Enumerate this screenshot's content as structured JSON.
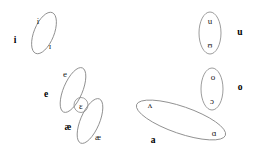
{
  "diagram": {
    "background_color": "#ffffff",
    "ellipse_stroke_color": "#8a8a8a",
    "glyph_color": "#1a1a1a",
    "label_color": "#000000",
    "groups": [
      {
        "id": "i-group",
        "label": "i",
        "label_position": "left",
        "members": [
          "i",
          "ɪ"
        ]
      },
      {
        "id": "e-group",
        "label": "e",
        "label_position": "left",
        "members": [
          "e",
          "ɛ"
        ]
      },
      {
        "id": "ae-group",
        "label": "æ",
        "label_position": "left",
        "members": [
          "ɛ",
          "æ"
        ]
      },
      {
        "id": "u-group",
        "label": "u",
        "label_position": "right",
        "members": [
          "u",
          "ʊ"
        ]
      },
      {
        "id": "o-group",
        "label": "o",
        "label_position": "right",
        "members": [
          "o",
          "ɔ"
        ]
      },
      {
        "id": "a-group",
        "label": "a",
        "label_position": "below-left",
        "members": [
          "ʌ",
          "ɑ"
        ]
      }
    ],
    "glyphs": [
      {
        "id": "glyph-i",
        "text": "i",
        "x": 38,
        "y": 21
      },
      {
        "id": "glyph-small-i",
        "text": "ɪ",
        "x": 50,
        "y": 46
      },
      {
        "id": "glyph-e",
        "text": "e",
        "x": 65,
        "y": 74
      },
      {
        "id": "glyph-eps",
        "text": "ɛ",
        "x": 81,
        "y": 106
      },
      {
        "id": "glyph-ae",
        "text": "æ",
        "x": 98,
        "y": 137
      },
      {
        "id": "glyph-u",
        "text": "u",
        "x": 210,
        "y": 21
      },
      {
        "id": "glyph-ups",
        "text": "ʊ",
        "x": 210,
        "y": 45
      },
      {
        "id": "glyph-o",
        "text": "o",
        "x": 213,
        "y": 77
      },
      {
        "id": "glyph-openo",
        "text": "ɔ",
        "x": 212,
        "y": 101
      },
      {
        "id": "glyph-wedge",
        "text": "ʌ",
        "x": 150,
        "y": 105
      },
      {
        "id": "glyph-script-a",
        "text": "ɑ",
        "x": 214,
        "y": 133
      }
    ],
    "labels": [
      {
        "id": "label-i",
        "text": "i",
        "x": 15,
        "y": 41
      },
      {
        "id": "label-e",
        "text": "e",
        "x": 46,
        "y": 95
      },
      {
        "id": "label-ae",
        "text": "æ",
        "x": 68,
        "y": 128
      },
      {
        "id": "label-u",
        "text": "u",
        "x": 240,
        "y": 33
      },
      {
        "id": "label-o",
        "text": "o",
        "x": 240,
        "y": 88
      },
      {
        "id": "label-a",
        "text": "a",
        "x": 153,
        "y": 141
      }
    ],
    "ellipses": [
      {
        "id": "ellipse-i",
        "cx": 44,
        "cy": 33,
        "rx": 10,
        "ry": 22,
        "rotate": 22
      },
      {
        "id": "ellipse-e",
        "cx": 73,
        "cy": 90,
        "rx": 9.5,
        "ry": 24,
        "rotate": 23
      },
      {
        "id": "ellipse-ae",
        "cx": 90,
        "cy": 121,
        "rx": 9.5,
        "ry": 24,
        "rotate": 23
      },
      {
        "id": "ellipse-eps",
        "cx": 81,
        "cy": 105,
        "rx": 7,
        "ry": 7.5,
        "rotate": 0
      },
      {
        "id": "ellipse-u",
        "cx": 210,
        "cy": 33,
        "rx": 11,
        "ry": 21,
        "rotate": 0
      },
      {
        "id": "ellipse-o",
        "cx": 212,
        "cy": 89,
        "rx": 11,
        "ry": 21,
        "rotate": 0
      },
      {
        "id": "ellipse-a",
        "cx": 181,
        "cy": 120,
        "rx": 47,
        "ry": 13.5,
        "rotate": 19
      }
    ]
  }
}
